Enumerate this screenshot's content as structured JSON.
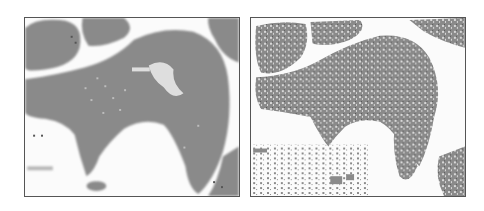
{
  "figure": {
    "panels": [
      {
        "id": "left",
        "description": "Grayscale segmentation map, smooth blobs",
        "fill_color": "#8a8a8a",
        "background_color": "#fbfbfb"
      },
      {
        "id": "right",
        "description": "Grayscale segmentation map, noisy speckled blobs",
        "fill_color": "#8a8a8a",
        "background_color": "#fbfbfb"
      }
    ],
    "border_color": "#555555"
  }
}
